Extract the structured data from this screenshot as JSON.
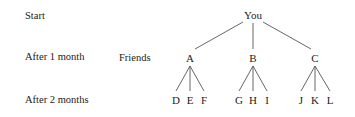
{
  "row_labels": {
    "start": "Start",
    "month1": "After 1 month",
    "month2": "After 2 months"
  },
  "group_label": "Friends",
  "tree": {
    "root": "You",
    "level1": [
      "A",
      "B",
      "C"
    ],
    "level2": [
      [
        "D",
        "E",
        "F"
      ],
      [
        "G",
        "H",
        "I"
      ],
      [
        "J",
        "K",
        "L"
      ]
    ]
  }
}
